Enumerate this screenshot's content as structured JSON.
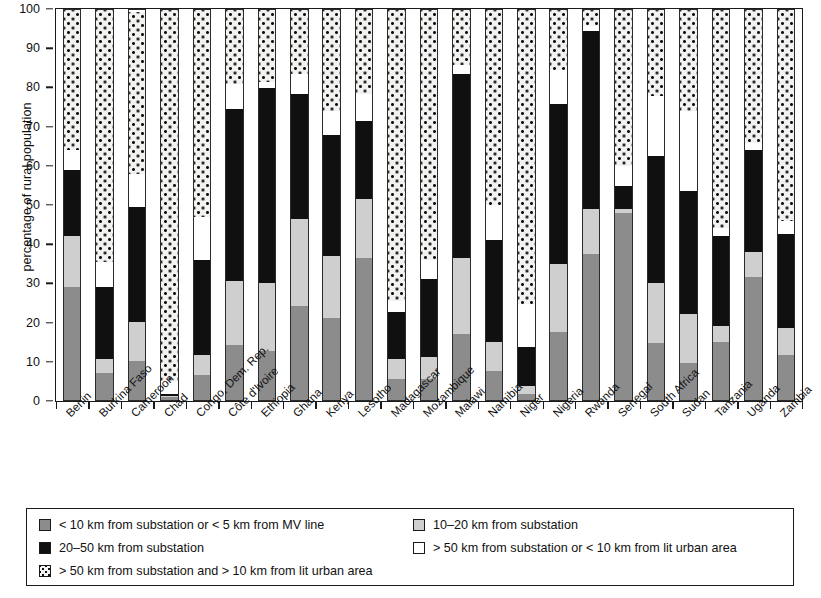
{
  "chart_data": {
    "type": "bar",
    "subtype": "stacked-bar-100",
    "title": "",
    "xlabel": "",
    "ylabel": "percentage of rural population",
    "ylim": [
      0,
      100
    ],
    "yticks": [
      0,
      10,
      20,
      30,
      40,
      50,
      60,
      70,
      80,
      90,
      100
    ],
    "grid": false,
    "legend_position": "bottom",
    "categories": [
      "Benin",
      "Burkina Faso",
      "Cameroon",
      "Chad",
      "Congo, Dem. Rep.",
      "Côte d'Ivoire",
      "Ethiopia",
      "Ghana",
      "Kenya",
      "Lesotho",
      "Madagascar",
      "Mozambique",
      "Malawi",
      "Namibia",
      "Niger",
      "Nigeria",
      "Rwanda",
      "Senegal",
      "South Africa",
      "Sudan",
      "Tanzania",
      "Uganda",
      "Zambia"
    ],
    "series": [
      {
        "name": "< 10 km from substation or < 5 km from MV line",
        "key": "s1",
        "color": "#8c8c8c",
        "values": [
          29,
          7,
          10,
          0.8,
          6.5,
          14,
          12.5,
          24,
          21,
          36.5,
          5.5,
          5.5,
          17,
          7.5,
          1.5,
          17.5,
          37.5,
          48,
          14.5,
          9.5,
          15,
          31.5,
          11.5
        ]
      },
      {
        "name": "10–20 km from substation",
        "key": "s2",
        "color": "#cfcfcf",
        "values": [
          13,
          3.5,
          10,
          0.2,
          5,
          16.5,
          17.5,
          22.5,
          16,
          15,
          5,
          5.5,
          19.5,
          7.5,
          2,
          17.5,
          11.5,
          1,
          15.5,
          12.5,
          4,
          6.5,
          7
        ]
      },
      {
        "name": "20–50 km from substation",
        "key": "s3",
        "color": "#101010",
        "values": [
          17,
          18.5,
          29.5,
          0.5,
          24.5,
          44,
          50,
          32,
          31,
          20,
          12,
          20,
          47,
          26,
          10,
          41,
          45.5,
          6,
          32.5,
          31.5,
          23,
          26,
          24
        ]
      },
      {
        "name": "> 50 km from substation or < 10 km from lit urban area",
        "key": "s4",
        "color": "#ffffff",
        "values": [
          5,
          6.5,
          8.5,
          3.5,
          11,
          6.5,
          1.5,
          5,
          6,
          7,
          3,
          5,
          2.5,
          9,
          11,
          8.5,
          1.5,
          5,
          15.5,
          20.5,
          2,
          2,
          3.5
        ]
      },
      {
        "name": "> 50 km from substation and > 10 km from lit urban area",
        "key": "s5",
        "color": "#f2f2f0",
        "values": [
          36,
          64.5,
          41.5,
          95,
          53,
          19,
          18.5,
          16.5,
          26,
          21.5,
          74.5,
          64,
          14,
          50,
          75.5,
          15.5,
          4,
          40,
          22,
          26,
          56,
          34,
          54
        ]
      }
    ]
  },
  "axis": {
    "y_title": "percentage of rural population",
    "y_tick_labels": [
      "0",
      "10",
      "20",
      "30",
      "40",
      "50",
      "60",
      "70",
      "80",
      "90",
      "100"
    ]
  },
  "legend": {
    "entries": [
      {
        "swatch": "s1",
        "label": "< 10 km from substation or < 5 km from MV line"
      },
      {
        "swatch": "s2",
        "label": "10–20 km from substation"
      },
      {
        "swatch": "s3",
        "label": "20–50 km from substation"
      },
      {
        "swatch": "s4",
        "label": "> 50 km from substation or < 10 km from lit urban area"
      },
      {
        "swatch": "s5",
        "label": "> 50 km from substation and > 10 km from lit urban area"
      }
    ]
  }
}
